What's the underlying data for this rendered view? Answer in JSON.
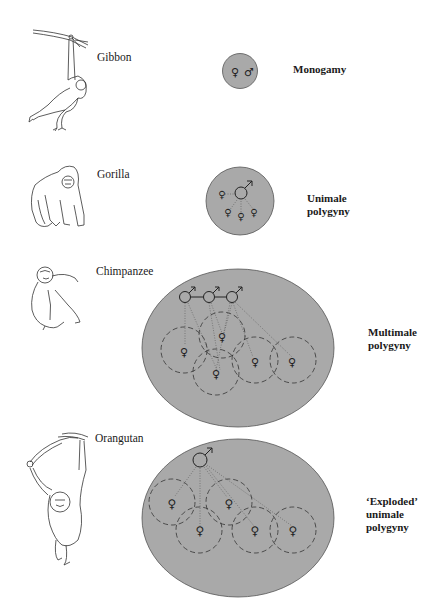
{
  "figure": {
    "rows": [
      {
        "species": "Gibbon",
        "system": "Monogamy",
        "system_lines": [
          "Monogamy"
        ]
      },
      {
        "species": "Gorilla",
        "system": "Unimale polygyny",
        "system_lines": [
          "Unimale",
          "polygyny"
        ]
      },
      {
        "species": "Chimpanzee",
        "system": "Multimale polygyny",
        "system_lines": [
          "Multimale",
          "polygyny"
        ]
      },
      {
        "species": "Orangutan",
        "system": "'Exploded' unimale polygyny",
        "system_lines": [
          "‘Exploded’",
          "unimale",
          "polygyny"
        ]
      }
    ],
    "symbols": {
      "female": "♀",
      "male": "♂"
    },
    "colors": {
      "group_fill": "#a9a9a9",
      "outline": "#555555",
      "background": "#ffffff"
    }
  }
}
